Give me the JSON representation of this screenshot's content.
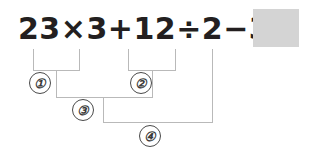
{
  "problem": {
    "expression_tokens": [
      "23",
      "×",
      "3",
      "+",
      "1",
      "2",
      "÷",
      "2",
      "−",
      "3",
      "="
    ],
    "expression_full": "23×3+12÷2−3=",
    "answer_value": "",
    "answer_placeholder": ""
  },
  "steps": [
    {
      "id": "step-1",
      "label": "①",
      "covers": "23×3"
    },
    {
      "id": "step-2",
      "label": "②",
      "covers": "12÷2"
    },
    {
      "id": "step-3",
      "label": "③",
      "covers": "23×3+12÷2"
    },
    {
      "id": "step-4",
      "label": "④",
      "covers": "23×3+12÷2−3"
    }
  ],
  "colors": {
    "text": "#231f20",
    "bracket": "#b9b9b9",
    "answer_box": "#d4d4d4",
    "circle_stroke": "#4a4a4a",
    "background": "#ffffff"
  }
}
